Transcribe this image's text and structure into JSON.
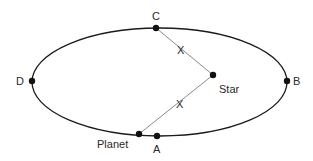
{
  "diagram": {
    "colors": {
      "stroke": "#1a1a1a",
      "line": "#8a8a8a",
      "dot": "#111111",
      "text": "#2a2a2a"
    },
    "orbit": {
      "cx": 159.5,
      "cy": 82,
      "rx": 127.5,
      "ry": 54
    },
    "star": {
      "x": 213,
      "y": 75,
      "label": "Star"
    },
    "planet": {
      "x": 139,
      "y": 134,
      "label": "Planet"
    },
    "points": [
      {
        "id": "A",
        "label": "A",
        "x": 157,
        "y": 136
      },
      {
        "id": "B",
        "label": "B",
        "x": 287,
        "y": 81
      },
      {
        "id": "C",
        "label": "C",
        "x": 156,
        "y": 28
      },
      {
        "id": "D",
        "label": "D",
        "x": 32,
        "y": 81
      }
    ],
    "segments": [
      {
        "from": "C",
        "to": "star",
        "label": "X"
      },
      {
        "from": "planet",
        "to": "star",
        "label": "X"
      }
    ]
  }
}
